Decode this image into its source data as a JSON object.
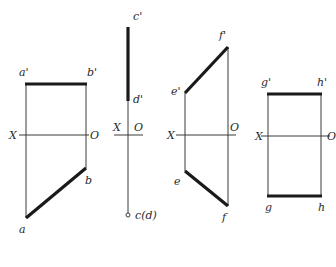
{
  "diagram": {
    "views": [
      {
        "id": "ab",
        "axis": {
          "left": "X",
          "right": "O"
        },
        "upper": {
          "start": "a'",
          "end": "b'"
        },
        "lower": {
          "start": "a",
          "end": "b"
        }
      },
      {
        "id": "cd",
        "axis": {
          "left": "X",
          "right": "O"
        },
        "upper": {
          "start": "c'",
          "end": "d'"
        },
        "lower": {
          "point": "c(d)"
        }
      },
      {
        "id": "ef",
        "axis": {
          "left": "X",
          "right": "O"
        },
        "upper": {
          "start": "e'",
          "end": "f'"
        },
        "lower": {
          "start": "e",
          "end": "f"
        }
      },
      {
        "id": "gh",
        "axis": {
          "left": "X",
          "right": "O"
        },
        "upper": {
          "start": "g'",
          "end": "h'"
        },
        "lower": {
          "start": "g",
          "end": "h"
        }
      }
    ]
  }
}
